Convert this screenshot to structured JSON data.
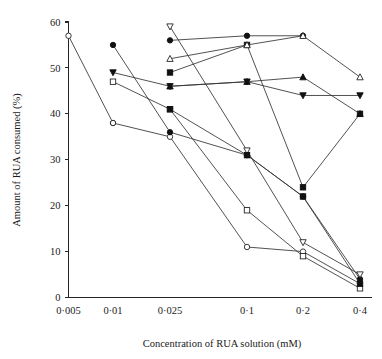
{
  "chart_data": {
    "type": "line",
    "title": "",
    "xlabel": "Concentration of RUA solution (mM)",
    "ylabel": "Amount of RUA consumed (%)",
    "x_tick_labels": [
      "0·005",
      "0·01",
      "0·025",
      "0·1",
      "0·2",
      "0·4"
    ],
    "x_categories": [
      0.005,
      0.01,
      0.025,
      0.1,
      0.2,
      0.4
    ],
    "y_tick_labels": [
      "0",
      "10",
      "20",
      "30",
      "40",
      "50",
      "60"
    ],
    "y_ticks": [
      0,
      10,
      20,
      30,
      40,
      50,
      60
    ],
    "ylim": [
      0,
      60
    ],
    "grid": false,
    "legend": "none",
    "axis_scale": "categorical",
    "series": [
      {
        "name": "series-open-circle-a",
        "marker": "open-circle",
        "x": [
          "0·005",
          "0·01"
        ],
        "values": [
          57,
          38
        ]
      },
      {
        "name": "series-open-circle-b",
        "marker": "open-circle",
        "x": [
          "0·01",
          "0·025",
          "0·1",
          "0·2",
          "0·4"
        ],
        "values": [
          38,
          35,
          11,
          10,
          3
        ]
      },
      {
        "name": "series-open-square",
        "marker": "open-square",
        "x": [
          "0·01",
          "0·025",
          "0·1",
          "0·2",
          "0·4"
        ],
        "values": [
          47,
          41,
          19,
          9,
          2
        ]
      },
      {
        "name": "series-filled-circle",
        "marker": "filled-circle",
        "x": [
          "0·01",
          "0·025",
          "0·1",
          "0·2",
          "0·4"
        ],
        "values": [
          55,
          36,
          31,
          22,
          4
        ]
      },
      {
        "name": "series-filled-triangle-down",
        "marker": "filled-triangle-down",
        "x": [
          "0·01",
          "0·025",
          "0·1",
          "0·2",
          "0·4"
        ],
        "values": [
          49,
          46,
          47,
          44,
          44
        ]
      },
      {
        "name": "series-open-triangle-down",
        "marker": "open-triangle-down",
        "x": [
          "0·025",
          "0·1",
          "0·2",
          "0·4"
        ],
        "values": [
          59,
          32,
          12,
          5
        ]
      },
      {
        "name": "series-filled-square",
        "marker": "filled-square",
        "x": [
          "0·025",
          "0·1",
          "0·2",
          "0·4"
        ],
        "values": [
          49,
          55,
          24,
          40
        ]
      },
      {
        "name": "series-filled-circle-high",
        "marker": "filled-circle",
        "x": [
          "0·025",
          "0·1",
          "0·2"
        ],
        "values": [
          56,
          57,
          57
        ]
      },
      {
        "name": "series-open-triangle-up",
        "marker": "open-triangle-up",
        "x": [
          "0·025",
          "0·1",
          "0·2",
          "0·4"
        ],
        "values": [
          52,
          55,
          57,
          48
        ]
      },
      {
        "name": "series-filled-triangle-up",
        "marker": "filled-triangle-up",
        "x": [
          "0·025",
          "0·1",
          "0·2",
          "0·4"
        ],
        "values": [
          46,
          47,
          48,
          40
        ]
      },
      {
        "name": "series-filled-square-low",
        "marker": "filled-square",
        "x": [
          "0·025",
          "0·1",
          "0·2",
          "0·4"
        ],
        "values": [
          41,
          31,
          22,
          3
        ]
      }
    ]
  },
  "colors": {
    "axis": "#262626",
    "line": "#333333",
    "marker_fill": "#111111",
    "marker_open": "#ffffff",
    "background": "#ffffff"
  }
}
